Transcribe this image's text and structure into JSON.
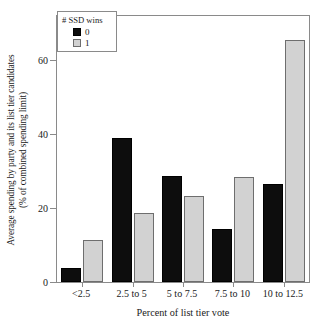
{
  "chart_data": {
    "type": "bar",
    "title": "",
    "xlabel": "Percent of list tier vote",
    "ylabel": "Average spending by party and its list tier candidates (% of combined spending limit)",
    "ylabel_line1": "Average spending by party and its list tier candidates",
    "ylabel_line2": "(% of combined spending limit)",
    "categories": [
      "<2.5",
      "2.5 to 5",
      "5 to 7.5",
      "7.5 to 10",
      "10 to 12.5"
    ],
    "series": [
      {
        "name": "0",
        "color": "#0d0d0d",
        "values": [
          3.8,
          39.0,
          28.8,
          14.4,
          26.4
        ]
      },
      {
        "name": "1",
        "color": "#d2d2d2",
        "values": [
          11.3,
          18.7,
          23.2,
          28.3,
          65.5
        ]
      }
    ],
    "ylim": [
      0,
      72
    ],
    "yticks": [
      0,
      20,
      40,
      60
    ],
    "ytick_labels": [
      "0",
      "20",
      "40",
      "60"
    ],
    "grid": false,
    "legend": {
      "title": "# SSD wins",
      "position": "top-left",
      "entries": [
        {
          "label": "0",
          "color": "#0d0d0d"
        },
        {
          "label": "1",
          "color": "#d2d2d2"
        }
      ]
    },
    "axis_color": "#8a8a8a"
  }
}
